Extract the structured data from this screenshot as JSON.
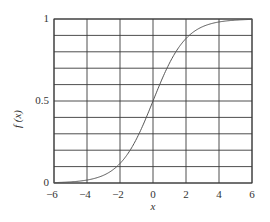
{
  "chart_data": {
    "type": "line",
    "title": "",
    "xlabel": "x",
    "ylabel": "f (x)",
    "xlim": [
      -6,
      6
    ],
    "ylim": [
      0,
      1
    ],
    "grid": true,
    "legend": null,
    "x_ticks": [
      -6,
      -4,
      -2,
      0,
      2,
      4,
      6
    ],
    "x_tick_labels": [
      "−6",
      "−4",
      "−2",
      "0",
      "2",
      "4",
      "6"
    ],
    "y_ticks": [
      0,
      0.5,
      1
    ],
    "y_tick_labels": [
      "0",
      "0.5",
      "1"
    ],
    "grid_x": [
      -6,
      -4,
      -2,
      0,
      2,
      4,
      6
    ],
    "grid_y": [
      0,
      0.1,
      0.2,
      0.3,
      0.4,
      0.5,
      0.6,
      0.7,
      0.8,
      0.9,
      1.0
    ],
    "series": [
      {
        "name": "f(x)",
        "x": [
          -6,
          -5,
          -4,
          -3,
          -2,
          -1,
          0,
          1,
          2,
          3,
          4,
          5,
          6
        ],
        "values": [
          0.0025,
          0.0067,
          0.018,
          0.047,
          0.119,
          0.269,
          0.5,
          0.731,
          0.881,
          0.953,
          0.982,
          0.993,
          0.9975
        ]
      }
    ]
  },
  "plot_area": {
    "left": 54,
    "top": 19,
    "right": 252,
    "bottom": 183
  },
  "colors": {
    "grid": "#3a3a3a",
    "curve": "#555555",
    "text": "#333333",
    "background": "#ffffff"
  }
}
